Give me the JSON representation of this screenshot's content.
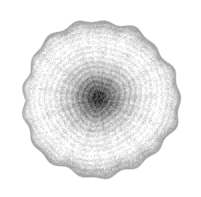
{
  "figure": {
    "description": "Grayscale circular cross-section with concentric growth rings radiating from a dark grainy core on a white background",
    "background_color": "#ffffff",
    "canvas": {
      "width": 201,
      "height": 197
    }
  },
  "chart_data": {
    "type": "heatmap",
    "subtitle": "",
    "xlabel": "",
    "ylabel": "",
    "legend": [],
    "annotations": [],
    "grid": false,
    "axis_visible": false,
    "tick_labels": [],
    "colormap": "grayscale",
    "colors": {
      "background": "#ffffff",
      "core_darkest": "#3a3a3a",
      "core_mid": "#6e6e6e",
      "mid_ring_light": "#f2f2f2",
      "mid_ring_dark": "#b4b4b4",
      "rim_outline": "#a8a8a8",
      "outer_fill": "#efefef"
    },
    "geometry": {
      "center_x": 100,
      "center_y": 99,
      "radius_mean": 78,
      "radius_min": 74,
      "radius_max": 82,
      "rim_thickness": 4,
      "boundary_irregularity": 0.045,
      "boundary_lobes": 17
    },
    "noise": {
      "grain_amplitude": 26,
      "grain_scale": 1.0,
      "angular_streak_amplitude": 14
    },
    "radial_profile": {
      "r_normalized": [
        0.0,
        0.04,
        0.08,
        0.12,
        0.16,
        0.2,
        0.24,
        0.28,
        0.32,
        0.36,
        0.4,
        0.44,
        0.48,
        0.52,
        0.56,
        0.6,
        0.64,
        0.68,
        0.72,
        0.76,
        0.8,
        0.84,
        0.88,
        0.92,
        0.96,
        1.0
      ],
      "gray_value": [
        58,
        64,
        76,
        92,
        112,
        131,
        148,
        163,
        176,
        188,
        198,
        208,
        216,
        223,
        229,
        234,
        238,
        241,
        243,
        244,
        243,
        240,
        235,
        227,
        214,
        186
      ]
    },
    "rings": [
      {
        "index": 1,
        "radius": 6,
        "gray": 62,
        "width": 3,
        "darkness": 0.78
      },
      {
        "index": 2,
        "radius": 11,
        "gray": 78,
        "width": 3,
        "darkness": 0.7
      },
      {
        "index": 3,
        "radius": 17,
        "gray": 96,
        "width": 3,
        "darkness": 0.62
      },
      {
        "index": 4,
        "radius": 23,
        "gray": 118,
        "width": 3,
        "darkness": 0.54
      },
      {
        "index": 5,
        "radius": 29,
        "gray": 138,
        "width": 3,
        "darkness": 0.46
      },
      {
        "index": 6,
        "radius": 35,
        "gray": 158,
        "width": 4,
        "darkness": 0.38
      },
      {
        "index": 7,
        "radius": 41,
        "gray": 175,
        "width": 4,
        "darkness": 0.31
      },
      {
        "index": 8,
        "radius": 47,
        "gray": 190,
        "width": 4,
        "darkness": 0.25
      },
      {
        "index": 9,
        "radius": 53,
        "gray": 203,
        "width": 4,
        "darkness": 0.2
      },
      {
        "index": 10,
        "radius": 58,
        "gray": 213,
        "width": 4,
        "darkness": 0.16
      },
      {
        "index": 11,
        "radius": 63,
        "gray": 222,
        "width": 4,
        "darkness": 0.13
      },
      {
        "index": 12,
        "radius": 68,
        "gray": 230,
        "width": 4,
        "darkness": 0.1
      },
      {
        "index": 13,
        "radius": 73,
        "gray": 236,
        "width": 4,
        "darkness": 0.08
      },
      {
        "index": 14,
        "radius": 78,
        "gray": 196,
        "width": 4,
        "darkness": 0.23
      }
    ],
    "ring_modulation": {
      "period_px": 5.4,
      "amplitude": 13,
      "phase_offset": 0.9,
      "eccentricity": 0.08,
      "center_offset_x": -2,
      "center_offset_y": -1
    }
  }
}
